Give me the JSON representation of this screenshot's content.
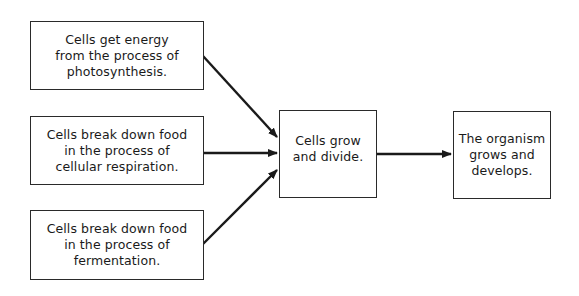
{
  "diagram": {
    "type": "flowchart",
    "colors": {
      "stroke": "#1a1a1a",
      "background": "#ffffff"
    },
    "nodes": [
      {
        "id": "photosynthesis",
        "text": "Cells get energy\nfrom the process of\nphotosynthesis."
      },
      {
        "id": "respiration",
        "text": "Cells break down food\nin the process of\ncellular respiration."
      },
      {
        "id": "fermentation",
        "text": "Cells break down food\nin the process of\nfermentation."
      },
      {
        "id": "grow-divide",
        "text": "Cells grow\nand divide."
      },
      {
        "id": "organism",
        "text": "The organism\ngrows and\ndevelops."
      }
    ],
    "edges": [
      {
        "from": "photosynthesis",
        "to": "grow-divide"
      },
      {
        "from": "respiration",
        "to": "grow-divide"
      },
      {
        "from": "fermentation",
        "to": "grow-divide"
      },
      {
        "from": "grow-divide",
        "to": "organism"
      }
    ]
  }
}
